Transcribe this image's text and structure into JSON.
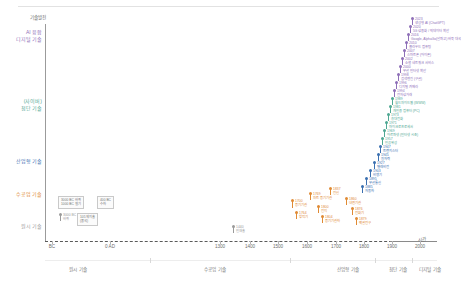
{
  "chart_data": {
    "type": "scatter",
    "title": "기술발전",
    "xlabel": "시간",
    "ylabel": "기술발전",
    "grid": false,
    "legend_position": "none",
    "x_ticks": [
      "BC",
      "0 AD",
      "1300",
      "1400",
      "1500",
      "1600",
      "1700",
      "1800",
      "1900",
      "2000"
    ],
    "y_categories": [
      "기술발전",
      "AI 융합\n디지털 기술",
      "(사이버)\n첨단 기술",
      "산업형 기술",
      "수공업 기술",
      "원시 기술"
    ],
    "eras": [
      "원시 기술",
      "수공업 기술",
      "산업형 기술",
      "첨단 기술",
      "디지털 기술"
    ],
    "series": [
      {
        "name": "원시 기술",
        "color": "#9a9a9a"
      },
      {
        "name": "수공업 기술",
        "color": "#e08a34"
      },
      {
        "name": "산업형 기술",
        "color": "#3a6fb0"
      },
      {
        "name": "첨단 기술",
        "color": "#4fa893"
      },
      {
        "name": "디지털 기술",
        "color": "#8e6fb8"
      }
    ],
    "points": [
      {
        "year": "3000 BC",
        "label": "바퀴",
        "era": "원시 기술"
      },
      {
        "year": "1000 BC",
        "label": "철기",
        "era": "원시 기술"
      },
      {
        "year": "400 BC",
        "label": "수차",
        "era": "원시 기술"
      },
      {
        "year": "105",
        "label": "제지술",
        "era": "원시 기술"
      },
      {
        "year": "1440",
        "label": "인쇄술",
        "era": "수공업 기술"
      },
      {
        "year": "1700",
        "label": "증기기관",
        "era": "수공업 기술"
      },
      {
        "year": "1764",
        "label": "방적기",
        "era": "수공업 기술"
      },
      {
        "year": "1800",
        "label": "전지",
        "era": "수공업 기술"
      },
      {
        "year": "1804",
        "label": "증기기관차",
        "era": "수공업 기술"
      },
      {
        "year": "1837",
        "label": "전신",
        "era": "수공업 기술"
      },
      {
        "year": "1860",
        "label": "내연기관",
        "era": "수공업 기술"
      },
      {
        "year": "1876",
        "label": "전화기",
        "era": "산업형 기술"
      },
      {
        "year": "1879",
        "label": "백열전구",
        "era": "산업형 기술"
      },
      {
        "year": "1885",
        "label": "자동차",
        "era": "산업형 기술"
      },
      {
        "year": "1895",
        "label": "무선통신",
        "era": "산업형 기술"
      },
      {
        "year": "1903",
        "label": "비행기",
        "era": "산업형 기술"
      },
      {
        "year": "1927",
        "label": "텔레비전",
        "era": "산업형 기술"
      },
      {
        "year": "1945",
        "label": "원자력",
        "era": "산업형 기술"
      },
      {
        "year": "1947",
        "label": "트랜지스터",
        "era": "산업형 기술"
      },
      {
        "year": "1957",
        "label": "인공위성",
        "era": "산업형 기술"
      },
      {
        "year": "1969",
        "label": "아르파넷 (인터넷 시초)",
        "era": "첨단 기술"
      },
      {
        "year": "1971",
        "label": "마이크로프로세서",
        "era": "첨단 기술"
      },
      {
        "year": "1973",
        "label": "휴대전화",
        "era": "첨단 기술"
      },
      {
        "year": "1981",
        "label": "개인용 컴퓨터 (PC)",
        "era": "첨단 기술"
      },
      {
        "year": "1989",
        "label": "월드와이드웹 (WWW)",
        "era": "첨단 기술"
      },
      {
        "year": "1994",
        "label": "전자상거래",
        "era": "첨단 기술"
      },
      {
        "year": "1996",
        "label": "디지털 카메라",
        "era": "첨단 기술"
      },
      {
        "year": "1998",
        "label": "검색엔진 (구글)",
        "era": "디지털 기술"
      },
      {
        "year": "2000",
        "label": "무선 인터넷 확산",
        "era": "디지털 기술"
      },
      {
        "year": "2002",
        "label": "소셜 네트워크 서비스",
        "era": "디지털 기술"
      },
      {
        "year": "2007",
        "label": "스마트폰 (아이폰)",
        "era": "디지털 기술"
      },
      {
        "year": "2010",
        "label": "클라우드 컴퓨팅",
        "era": "디지털 기술"
      },
      {
        "year": "2016",
        "label": "알파고 (인공지능 바둑)",
        "era": "디지털 기술"
      },
      {
        "year": "2020",
        "label": "5G 상용화 / 빅데이터",
        "era": "디지털 기술"
      },
      {
        "year": "2022",
        "label": "생성형 AI (ChatGPT)",
        "era": "디지털 기술"
      }
    ]
  },
  "axis": {
    "y_title": "기술발전",
    "x_title": "시간",
    "y_labels": [
      {
        "text": "AI 융합",
        "sub": "디지털 기술",
        "color": "#8e6fb8"
      },
      {
        "text": "(사이버)",
        "sub": "첨단 기술",
        "color": "#4fa893"
      },
      {
        "text": "산업형 기술",
        "sub": "",
        "color": "#3a6fb0"
      },
      {
        "text": "수공업 기술",
        "sub": "",
        "color": "#e08a34"
      },
      {
        "text": "원시 기술",
        "sub": "",
        "color": "#9a9a9a"
      }
    ],
    "x_ticks": [
      {
        "label": "BC",
        "x": 52
      },
      {
        "label": "0 AD",
        "x": 110
      },
      {
        "label": "1300",
        "x": 220
      },
      {
        "label": "1400",
        "x": 250
      },
      {
        "label": "1500",
        "x": 278
      },
      {
        "label": "1600",
        "x": 307
      },
      {
        "label": "1700",
        "x": 336
      },
      {
        "label": "1800",
        "x": 364
      },
      {
        "label": "1900",
        "x": 392
      },
      {
        "label": "2000",
        "x": 420
      }
    ],
    "eras": [
      {
        "label": "원시 기술",
        "x": 78
      },
      {
        "label": "수공업 기술",
        "x": 215
      },
      {
        "label": "산업형 기술",
        "x": 348
      },
      {
        "label": "첨단 기술",
        "x": 398
      },
      {
        "label": "디지털 기술",
        "x": 430
      }
    ]
  },
  "boxes": [
    {
      "text": "3000 BC 바퀴\n1000 BC 철기",
      "x": 58,
      "y": 196
    },
    {
      "text": "400 BC\n수차",
      "x": 97,
      "y": 196
    },
    {
      "text": "105 제지술\n(중국)",
      "x": 77,
      "y": 213
    }
  ],
  "markers": [
    {
      "year": "3000 BC",
      "label": "바퀴",
      "x": 60,
      "y": 214,
      "color": "#9a9a9a",
      "stem": 6
    },
    {
      "year": "1440",
      "label": "인쇄술",
      "x": 233,
      "y": 226,
      "color": "#9a9a9a",
      "stem": 6
    },
    {
      "year": "1700",
      "label": "증기기관",
      "x": 292,
      "y": 200,
      "color": "#e08a34",
      "stem": 7
    },
    {
      "year": "1764",
      "label": "방적기",
      "x": 296,
      "y": 212,
      "color": "#e08a34",
      "stem": 6
    },
    {
      "year": "1769",
      "label": "와트 증기기관",
      "x": 310,
      "y": 193,
      "color": "#e08a34",
      "stem": 6
    },
    {
      "year": "1800",
      "label": "전지",
      "x": 318,
      "y": 206,
      "color": "#e08a34",
      "stem": 6
    },
    {
      "year": "1804",
      "label": "증기기관차",
      "x": 322,
      "y": 216,
      "color": "#e08a34",
      "stem": 6
    },
    {
      "year": "1837",
      "label": "전신",
      "x": 330,
      "y": 188,
      "color": "#e08a34",
      "stem": 6
    },
    {
      "year": "1860",
      "label": "내연기관",
      "x": 346,
      "y": 198,
      "color": "#e08a34",
      "stem": 6
    },
    {
      "year": "1876",
      "label": "전화기",
      "x": 352,
      "y": 208,
      "color": "#e08a34",
      "stem": 6
    },
    {
      "year": "1879",
      "label": "백열전구",
      "x": 356,
      "y": 218,
      "color": "#e08a34",
      "stem": 6
    },
    {
      "year": "1885",
      "label": "자동차",
      "x": 362,
      "y": 186,
      "color": "#3a6fb0",
      "stem": 6
    },
    {
      "year": "1895",
      "label": "무선통신",
      "x": 366,
      "y": 178,
      "color": "#3a6fb0",
      "stem": 6
    },
    {
      "year": "1903",
      "label": "비행기",
      "x": 370,
      "y": 170,
      "color": "#3a6fb0",
      "stem": 6
    },
    {
      "year": "1927",
      "label": "텔레비전",
      "x": 374,
      "y": 162,
      "color": "#3a6fb0",
      "stem": 6
    },
    {
      "year": "1945",
      "label": "원자력",
      "x": 378,
      "y": 154,
      "color": "#3a6fb0",
      "stem": 6
    },
    {
      "year": "1947",
      "label": "트랜지스터",
      "x": 380,
      "y": 146,
      "color": "#3a6fb0",
      "stem": 6
    },
    {
      "year": "1957",
      "label": "인공위성",
      "x": 382,
      "y": 138,
      "color": "#4fa893",
      "stem": 6
    },
    {
      "year": "1969",
      "label": "아르파넷 (인터넷 시초)",
      "x": 384,
      "y": 130,
      "color": "#4fa893",
      "stem": 6
    },
    {
      "year": "1971",
      "label": "마이크로프로세서",
      "x": 386,
      "y": 122,
      "color": "#4fa893",
      "stem": 6
    },
    {
      "year": "1973",
      "label": "휴대전화",
      "x": 388,
      "y": 114,
      "color": "#4fa893",
      "stem": 6
    },
    {
      "year": "1981",
      "label": "개인용 컴퓨터 (PC)",
      "x": 390,
      "y": 106,
      "color": "#4fa893",
      "stem": 6
    },
    {
      "year": "1989",
      "label": "월드와이드웹 (WWW)",
      "x": 392,
      "y": 98,
      "color": "#4fa893",
      "stem": 6
    },
    {
      "year": "1994",
      "label": "전자상거래",
      "x": 394,
      "y": 90,
      "color": "#8e6fb8",
      "stem": 6
    },
    {
      "year": "1996",
      "label": "디지털 카메라",
      "x": 396,
      "y": 82,
      "color": "#8e6fb8",
      "stem": 6
    },
    {
      "year": "1998",
      "label": "검색엔진 (구글)",
      "x": 398,
      "y": 74,
      "color": "#8e6fb8",
      "stem": 6
    },
    {
      "year": "2000",
      "label": "무선 인터넷 확산",
      "x": 400,
      "y": 66,
      "color": "#8e6fb8",
      "stem": 6
    },
    {
      "year": "2002",
      "label": "소셜 네트워크 서비스",
      "x": 402,
      "y": 58,
      "color": "#8e6fb8",
      "stem": 6
    },
    {
      "year": "2007",
      "label": "스마트폰 (아이폰)",
      "x": 404,
      "y": 50,
      "color": "#8e6fb8",
      "stem": 6
    },
    {
      "year": "2010",
      "label": "클라우드 컴퓨팅",
      "x": 406,
      "y": 42,
      "color": "#8e6fb8",
      "stem": 6
    },
    {
      "year": "2016",
      "label": "Google, AlphaGo(알파고) 바둑 대국",
      "x": 408,
      "y": 34,
      "color": "#8e6fb8",
      "stem": 6
    },
    {
      "year": "2020",
      "label": "5G 상용화 / 빅데이터 확산",
      "x": 410,
      "y": 26,
      "color": "#8e6fb8",
      "stem": 6
    },
    {
      "year": "2023",
      "label": "생성형 AI (ChatGPT)",
      "x": 412,
      "y": 18,
      "color": "#8e6fb8",
      "stem": 6
    }
  ]
}
